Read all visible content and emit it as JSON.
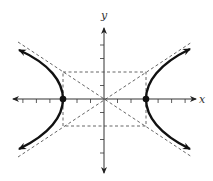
{
  "diagram": {
    "type": "hyperbola",
    "equation_params": {
      "a": 3,
      "b": 2
    },
    "vertices": [
      [
        -3,
        0
      ],
      [
        3,
        0
      ]
    ],
    "asymptotes": [
      "y = 2/3 x",
      "y = -2/3 x"
    ],
    "axes": {
      "x_label": "x",
      "y_label": "y",
      "x_ticks": [
        -6,
        -5,
        -4,
        -3,
        -2,
        -1,
        1,
        2,
        3,
        4,
        5,
        6
      ],
      "y_ticks": [
        -5,
        -4,
        -3,
        -2,
        -1,
        1,
        2,
        3,
        4,
        5
      ]
    },
    "colors": {
      "curve": "#111111",
      "axes": "#333333",
      "dashed": "#555555"
    }
  }
}
